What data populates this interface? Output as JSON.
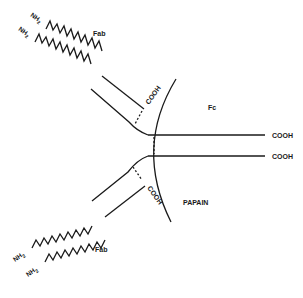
{
  "diagram": {
    "title": "",
    "labels": {
      "fab_top": "Fab",
      "fab_bottom": "Fab",
      "fc": "Fc",
      "papain": "PAPAIN",
      "nh2_top_1": "NH",
      "nh2_top_2": "NH",
      "nh2_bottom_1": "NH",
      "nh2_bottom_2": "NH",
      "nh2_sub": "2",
      "cooh_upper_fab": "COOH",
      "cooh_lower_fab": "COOH",
      "cooh_fc_1": "COOH",
      "cooh_fc_2": "COOH"
    },
    "colors": {
      "line": "#1a1a1a",
      "background": "#ffffff"
    }
  }
}
